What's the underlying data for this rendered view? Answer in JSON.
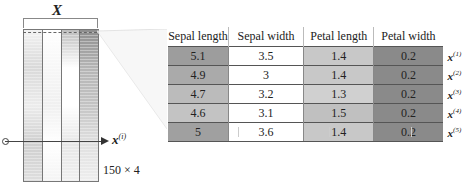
{
  "matrix": {
    "title": "X",
    "dimensions": "150 × 4",
    "row_vector_label": "x",
    "row_vector_superscript": "(i)",
    "column_gradients": [
      [
        "#f2f2f2",
        "#d9d9d9",
        "#ececec",
        "#cfcfcf",
        "#dedede"
      ],
      [
        "#ffffff",
        "#f7f7f7",
        "#f0f0f0",
        "#ffffff",
        "#f4f4f4"
      ],
      [
        "#bdbdbd",
        "#ffffff",
        "#ffffff",
        "#e6e6e6",
        "#f0f0f0"
      ],
      [
        "#8e8e8e",
        "#b5b5b5",
        "#c4c4c4",
        "#e0e0e0",
        "#eeeeee"
      ]
    ]
  },
  "table": {
    "headers": [
      "Sepal length",
      "Sepal width",
      "Petal length",
      "Petal width"
    ],
    "rows": [
      {
        "values": [
          "5.1",
          "3.5",
          "1.4",
          "0.2"
        ],
        "label": "x",
        "sup": "(1)",
        "colors": [
          "#9d9d9d",
          "#ffffff",
          "#c8c8c8",
          "#8a8a8a"
        ]
      },
      {
        "values": [
          "4.9",
          "3",
          "1.4",
          "0.2"
        ],
        "label": "x",
        "sup": "(2)",
        "colors": [
          "#aaaaaa",
          "#ffffff",
          "#c8c8c8",
          "#8a8a8a"
        ]
      },
      {
        "values": [
          "4.7",
          "3.2",
          "1.3",
          "0.2"
        ],
        "label": "x",
        "sup": "(3)",
        "colors": [
          "#bbbbbb",
          "#ffffff",
          "#d0d0d0",
          "#8a8a8a"
        ]
      },
      {
        "values": [
          "4.6",
          "3.1",
          "1.5",
          "0.2"
        ],
        "label": "x",
        "sup": "(4)",
        "colors": [
          "#c3c3c3",
          "#ffffff",
          "#c0c0c0",
          "#8a8a8a"
        ]
      },
      {
        "values": [
          "5",
          "3.6",
          "1.4",
          "0.2"
        ],
        "label": "x",
        "sup": "(5)",
        "colors": [
          "#a0a0a0",
          "#ffffff",
          "#c8c8c8",
          "#8a8a8a"
        ]
      }
    ]
  }
}
